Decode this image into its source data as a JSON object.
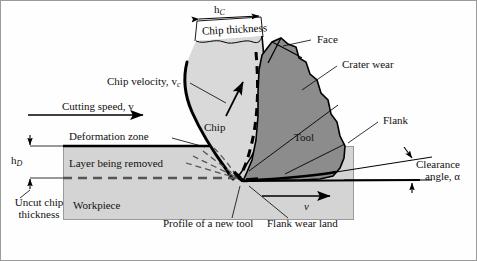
{
  "figure": {
    "colors": {
      "workpiece_fill": "#d4d4d4",
      "chip_fill": "#d9d9d9",
      "tool_fill": "#8c8c8c",
      "outline": "#000000",
      "background": "#fefefe",
      "frame": "#9a9a9a"
    }
  },
  "labels": {
    "chip_thickness_symbol": "h",
    "chip_thickness_symbol_sub": "C",
    "chip_thickness": "Chip thickness",
    "chip_velocity": "Chip velocity, ",
    "chip_velocity_symbol": "v",
    "chip_velocity_symbol_sub": "c",
    "cutting_speed": "Cutting speed, ",
    "cutting_speed_symbol": "v",
    "deformation_zone": "Deformation zone",
    "chip": "Chip",
    "face": "Face",
    "crater_wear": "Crater wear",
    "tool": "Tool",
    "flank": "Flank",
    "clearance_line1": "Clearance",
    "clearance_line2": "angle, α",
    "uncut_symbol": "h",
    "uncut_symbol_sub": "D",
    "uncut_line1": "Uncut chip",
    "uncut_line2": "thickness",
    "layer_being_removed": "Layer being removed",
    "workpiece": "Workpiece",
    "profile_new_tool": "Profile of a new tool",
    "flank_wear_land": "Flank wear land",
    "speed_arrow_symbol": "v"
  }
}
